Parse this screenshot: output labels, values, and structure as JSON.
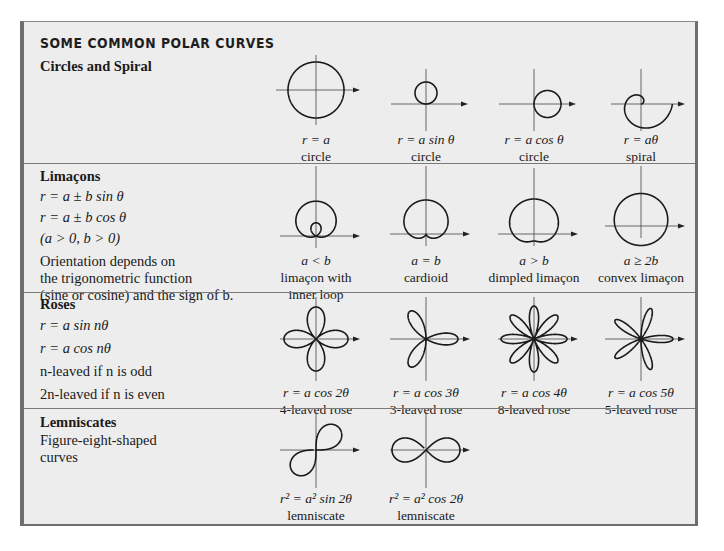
{
  "title": "SOME COMMON POLAR CURVES",
  "colors": {
    "panel_bg": "#ededed",
    "border": "#6e6e6e",
    "curve": "#1a1a1a"
  },
  "sections": [
    {
      "heading": "Circles and Spiral",
      "lines": [],
      "figures": [
        {
          "equation": "r = a",
          "name": "circle",
          "curve": "circle-centered"
        },
        {
          "equation": "r = a sin θ",
          "name": "circle",
          "curve": "circle-sin"
        },
        {
          "equation": "r = a cos θ",
          "name": "circle",
          "curve": "circle-cos"
        },
        {
          "equation": "r = aθ",
          "name": "spiral",
          "curve": "archimedean-spiral"
        }
      ]
    },
    {
      "heading": "Limaçons",
      "lines": [
        "r = a ± b sin θ",
        "r = a ± b cos θ",
        "(a > 0, b > 0)",
        "Orientation depends on",
        "the trigonometric function",
        "(sine or cosine) and the sign of b."
      ],
      "figures": [
        {
          "equation": "a < b",
          "name": "limaçon with",
          "name2": "inner loop",
          "curve": "limacon-inner-loop"
        },
        {
          "equation": "a = b",
          "name": "cardioid",
          "curve": "cardioid"
        },
        {
          "equation": "a > b",
          "name": "dimpled limaçon",
          "curve": "dimpled-limacon"
        },
        {
          "equation": "a ≥ 2b",
          "name": "convex limaçon",
          "curve": "convex-limacon"
        }
      ]
    },
    {
      "heading": "Roses",
      "lines": [
        "r = a sin nθ",
        "r = a cos nθ",
        "n-leaved if n is odd",
        "2n-leaved if n is even"
      ],
      "figures": [
        {
          "equation": "r = a cos 2θ",
          "name": "4-leaved rose",
          "curve": "rose-4"
        },
        {
          "equation": "r = a cos 3θ",
          "name": "3-leaved rose",
          "curve": "rose-3"
        },
        {
          "equation": "r = a cos 4θ",
          "name": "8-leaved rose",
          "curve": "rose-8"
        },
        {
          "equation": "r = a cos 5θ",
          "name": "5-leaved rose",
          "curve": "rose-5"
        }
      ]
    },
    {
      "heading": "Lemniscates",
      "lines": [
        "Figure-eight-shaped",
        "curves"
      ],
      "figures": [
        {
          "equation": "r² = a² sin 2θ",
          "name": "lemniscate",
          "curve": "lemniscate-sin"
        },
        {
          "equation": "r² = a² cos 2θ",
          "name": "lemniscate",
          "curve": "lemniscate-cos"
        }
      ]
    }
  ]
}
